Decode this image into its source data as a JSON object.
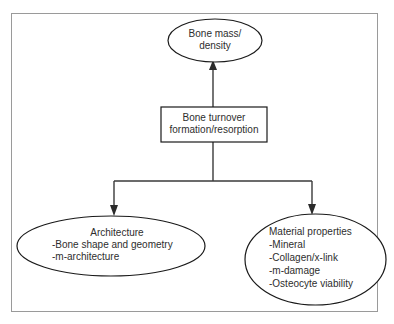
{
  "diagram": {
    "title_present": false,
    "type": "flowchart",
    "background_color": "#ffffff",
    "frame_color": "#9a9a9a",
    "node_stroke_color": "#1a1a1a",
    "connector_color": "#3a3a3a",
    "text_color": "#2e2e2e",
    "nodes": {
      "bone_mass": {
        "shape": "ellipse",
        "lines": [
          "Bone mass/",
          "density"
        ],
        "align": "center"
      },
      "bone_turnover": {
        "shape": "rectangle",
        "lines": [
          "Bone turnover",
          "formation/resorption"
        ],
        "align": "center"
      },
      "architecture": {
        "shape": "ellipse",
        "heading": "Architecture",
        "items": [
          "-Bone shape and geometry",
          "-m-architecture"
        ],
        "align": "left"
      },
      "material_properties": {
        "shape": "ellipse",
        "heading": "Material properties",
        "items": [
          "-Mineral",
          "-Collagen/x-link",
          "-m-damage",
          "-Osteocyte viability"
        ],
        "align": "left"
      }
    },
    "edges": [
      {
        "from": "bone_turnover",
        "to": "bone_mass",
        "style": "arrow-up"
      },
      {
        "from": "bone_turnover",
        "to": "architecture",
        "style": "arrow-down-left"
      },
      {
        "from": "bone_turnover",
        "to": "material_properties",
        "style": "arrow-down-right"
      }
    ]
  }
}
